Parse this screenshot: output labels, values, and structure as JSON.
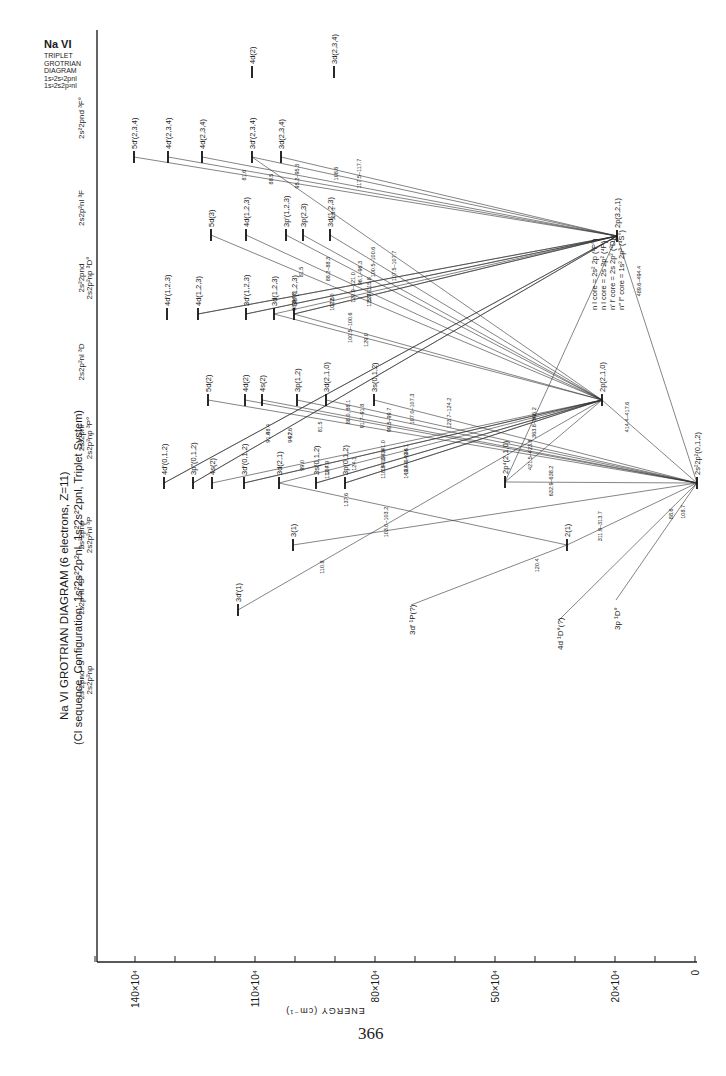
{
  "page": {
    "number": "366",
    "title": "Na VI  GROTRIAN DIAGRAM (6 electrons, Z=11)",
    "subtitle": "(CI sequence, Configuration: 1s²2s²2p²nl, 1s²2s²2pnl, Triplet System)",
    "corner_title": [
      "Na VI",
      "TRIPLET",
      "GROTRIAN",
      "DIAGRAM",
      "1s²2s²2pnl",
      "1s²2s2p²nl"
    ]
  },
  "chart_data": {
    "type": "grotrian-diagram",
    "title": "Na VI GROTRIAN DIAGRAM (6 electrons, Z=11)",
    "subtitle": "(CI sequence, Configuration: 1s²2s²2p²nl, 1s²2s²2pnl, Triplet System)",
    "xlabel": "ENERGY (cm⁻¹)",
    "axis": {
      "orientation": "horizontal, decreasing to the right",
      "ticks": [
        {
          "label": "140×10⁴",
          "value": 1400000
        },
        {
          "label": "110×10⁴",
          "value": 1100000
        },
        {
          "label": "80×10⁴",
          "value": 800000
        },
        {
          "label": "50×10⁴",
          "value": 500000
        },
        {
          "label": "20×10⁴",
          "value": 200000
        },
        {
          "label": "0",
          "value": 0
        }
      ],
      "minor_tick_step": 100000,
      "range": [
        0,
        1500000
      ]
    },
    "columns": [
      {
        "id": "3Fo",
        "label": "2s²2pnd ³F°",
        "y": 78
      },
      {
        "id": "3F",
        "label": "2s2p²nl ³F",
        "y": 168
      },
      {
        "id": "3Do",
        "label": "2s²2pnd / 2s2p²np ³D°",
        "y": 238
      },
      {
        "id": "3D",
        "label": "2s2p²nl ³D",
        "y": 322
      },
      {
        "id": "3Po",
        "label": "2s²2pnl / 2s2p²np ³P°",
        "y": 398
      },
      {
        "id": "3P",
        "label": "2s²2pnp / 2s2p²nl ³P",
        "y": 495
      },
      {
        "id": "3So",
        "label": "2s2p²nl ³S°",
        "y": 555
      },
      {
        "id": "3S",
        "label": "2s²2pnd ³S / 2s2p²np",
        "y": 640
      }
    ],
    "legend": [
      "n l core = 2s² 2p (²P°)",
      "n l core = 2s 2p² (⁴P)",
      "n′ l′ core = 2s 2p² (²D)",
      "n‴ l‴ core = 1s² 2p³ (⁴S°)"
    ],
    "levels": [
      {
        "id": "gs",
        "label": "2s²2p²(0,1,2)",
        "x": 697,
        "y": 483
      },
      {
        "id": "p321",
        "label": "2p(3,2,1)",
        "x": 617,
        "y": 236
      },
      {
        "id": "p210",
        "label": "2p(2,1,0)",
        "x": 602,
        "y": 400
      },
      {
        "id": "p4",
        "label": "2p⁴(2,1,0)",
        "x": 505,
        "y": 482
      },
      {
        "id": "s21",
        "label": "2(1)",
        "x": 567,
        "y": 545
      },
      {
        "id": "fo_4d",
        "label": "4d(2)",
        "x": 252,
        "y": 72
      },
      {
        "id": "fo_3d",
        "label": "3d(2,3,4)",
        "x": 334,
        "y": 72
      },
      {
        "id": "f_5dp",
        "label": "5d′(2,3,4)",
        "x": 134,
        "y": 157
      },
      {
        "id": "f_4dp",
        "label": "4d′(2,3,4)",
        "x": 168,
        "y": 157
      },
      {
        "id": "f_4d",
        "label": "4d(2,3,4)",
        "x": 202,
        "y": 157
      },
      {
        "id": "f_3dp",
        "label": "3d′(2,3,4)",
        "x": 252,
        "y": 157
      },
      {
        "id": "f_3d",
        "label": "3d(2,3,4)",
        "x": 281,
        "y": 157
      },
      {
        "id": "do_5d",
        "label": "5d(3)",
        "x": 211,
        "y": 235
      },
      {
        "id": "do_4d",
        "label": "4d(1,2,3)",
        "x": 246,
        "y": 235
      },
      {
        "id": "do_3pp",
        "label": "3p′(1,2,3)",
        "x": 286,
        "y": 235
      },
      {
        "id": "do_3p",
        "label": "3p(2,3)",
        "x": 303,
        "y": 235
      },
      {
        "id": "do_3d",
        "label": "3d(1,2,3)",
        "x": 330,
        "y": 235
      },
      {
        "id": "d_4dp",
        "label": "4d′(1,2,3)",
        "x": 167,
        "y": 314
      },
      {
        "id": "d_4d",
        "label": "4d(1,2,3)",
        "x": 198,
        "y": 314
      },
      {
        "id": "d_3dp",
        "label": "3d′(1,2,3)",
        "x": 246,
        "y": 314
      },
      {
        "id": "d_3d",
        "label": "3d(1,2,3)",
        "x": 274,
        "y": 314
      },
      {
        "id": "d_3sp",
        "label": "3s′(1,2,3)",
        "x": 294,
        "y": 314
      },
      {
        "id": "po_5d",
        "label": "5d(2)",
        "x": 208,
        "y": 400
      },
      {
        "id": "po_4d",
        "label": "4d(2)",
        "x": 245,
        "y": 400
      },
      {
        "id": "po_4s",
        "label": "4s(2)",
        "x": 262,
        "y": 400
      },
      {
        "id": "po_3p",
        "label": "3p(1,2)",
        "x": 297,
        "y": 400
      },
      {
        "id": "po_3d",
        "label": "3d(2,1,0)",
        "x": 326,
        "y": 400
      },
      {
        "id": "po_3s",
        "label": "3s(0,1,2)",
        "x": 374,
        "y": 400
      },
      {
        "id": "p_4dp",
        "label": "4d′(0,1,2)",
        "x": 164,
        "y": 483
      },
      {
        "id": "p_3pp",
        "label": "3p‴(0,1,2)",
        "x": 193,
        "y": 483
      },
      {
        "id": "p_4s",
        "label": "4s(2)",
        "x": 212,
        "y": 483
      },
      {
        "id": "p_3dp",
        "label": "3d′(0,1,2)",
        "x": 244,
        "y": 483
      },
      {
        "id": "p_3d",
        "label": "3d(2,1)",
        "x": 279,
        "y": 483
      },
      {
        "id": "p_3s",
        "label": "3s(0,1,2)",
        "x": 316,
        "y": 483
      },
      {
        "id": "p_3p",
        "label": "3p(0,1,2)",
        "x": 345,
        "y": 483
      },
      {
        "id": "so_3",
        "label": "3(1)",
        "x": 293,
        "y": 545
      },
      {
        "id": "s_3dp",
        "label": "3d′(1)",
        "x": 238,
        "y": 610
      }
    ],
    "transitions": [
      {
        "from": "f_5dp",
        "to": "p321",
        "wavelength": "81.6"
      },
      {
        "from": "f_4dp",
        "to": "p321",
        "wavelength": "88.5"
      },
      {
        "from": "f_4d",
        "to": "p321",
        "wavelength": "95.2–95.3"
      },
      {
        "from": "f_3dp",
        "to": "p321",
        "wavelength": "108.6"
      },
      {
        "from": "f_3dp",
        "to": "p210",
        "wavelength": "113.1"
      },
      {
        "from": "f_3d",
        "to": "p321",
        "wavelength": "117.5–117.7"
      },
      {
        "from": "do_5d",
        "to": "p210",
        "wavelength": "81.5"
      },
      {
        "from": "do_4d",
        "to": "p210",
        "wavelength": "88.2–88.3"
      },
      {
        "from": "do_3pp",
        "to": "p210",
        "wavelength": "96.1–96.3"
      },
      {
        "from": "do_3p",
        "to": "p210",
        "wavelength": "100.5–100.6"
      },
      {
        "from": "do_3d",
        "to": "p210",
        "wavelength": "107.5–107.7"
      },
      {
        "from": "d_4d",
        "to": "p321",
        "wavelength": "98.3"
      },
      {
        "from": "d_4d",
        "to": "p321",
        "wavelength": "94.8"
      },
      {
        "from": "d_3dp",
        "to": "p321",
        "wavelength": "112.0"
      },
      {
        "from": "d_3dp",
        "to": "p321",
        "wavelength": "107.5"
      },
      {
        "from": "d_3d",
        "to": "p321",
        "wavelength": "120.9–121.0"
      },
      {
        "from": "d_3sp",
        "to": "p321",
        "wavelength": "115.7–115.8"
      },
      {
        "from": "d_3sp",
        "to": "p210",
        "wavelength": "129.0"
      },
      {
        "from": "d_3sp",
        "to": "p321",
        "wavelength": "123.1"
      },
      {
        "from": "d_3d",
        "to": "p210",
        "wavelength": "100.5–100.6"
      },
      {
        "from": "po_5d",
        "to": "gs",
        "wavelength": "81.5"
      },
      {
        "from": "po_4d",
        "to": "gs",
        "wavelength": "88.0, 88.1"
      },
      {
        "from": "po_4s",
        "to": "gs",
        "wavelength": "91.7–91.8"
      },
      {
        "from": "po_3p",
        "to": "gs",
        "wavelength": "99.5–99.7"
      },
      {
        "from": "po_3d",
        "to": "gs",
        "wavelength": "107.0–107.3"
      },
      {
        "from": "po_3s",
        "to": "gs",
        "wavelength": "123.7–124.2"
      },
      {
        "from": "p_4dp",
        "to": "p321",
        "wavelength": "91.4"
      },
      {
        "from": "p_4dp",
        "to": "p321",
        "wavelength": "88.4"
      },
      {
        "from": "p_3pp",
        "to": "p321",
        "wavelength": "97.6"
      },
      {
        "from": "p_3pp",
        "to": "p321",
        "wavelength": "94.2"
      },
      {
        "from": "p_4s",
        "to": "p210",
        "wavelength": "99.0"
      },
      {
        "from": "p_3dp",
        "to": "p210",
        "wavelength": "107.9"
      },
      {
        "from": "p_3dp",
        "to": "p210",
        "wavelength": "112.4"
      },
      {
        "from": "p_3d",
        "to": "p210",
        "wavelength": "124.1"
      },
      {
        "from": "p_3d",
        "to": "s21",
        "wavelength": "137.6"
      },
      {
        "from": "p_3s",
        "to": "p210",
        "wavelength": "118.5–118.6"
      },
      {
        "from": "p_3s",
        "to": "p210",
        "wavelength": "140.8–141.0"
      },
      {
        "from": "p_3p",
        "to": "p210",
        "wavelength": "133.8–134.1"
      },
      {
        "from": "p_3p",
        "to": "p210",
        "wavelength": "149.4–149.6"
      },
      {
        "from": "so_3",
        "to": "gs",
        "wavelength": "103.0–103.2"
      },
      {
        "from": "s_3dp",
        "to": "p210",
        "wavelength": "110.8"
      },
      {
        "from": "p4",
        "to": "gs",
        "wavelength": "632.9–638.2"
      },
      {
        "from": "p4",
        "to": "p210",
        "wavelength": "421.5–423.8"
      },
      {
        "from": "p4",
        "to": "p321",
        "wavelength": "363.8–366.2"
      },
      {
        "from": "p210",
        "to": "gs",
        "wavelength": "414.4–417.6"
      },
      {
        "from": "p321",
        "to": "gs",
        "wavelength": "489.6–494.4"
      },
      {
        "from": "s21",
        "to": "gs",
        "wavelength": "311.9–313.7"
      },
      {
        "from": "s21",
        "to": "3d′ ¹P(?)",
        "wavelength": "120.4"
      },
      {
        "from": "gs",
        "to": "4d ¹D°(?)",
        "wavelength": "88.6"
      },
      {
        "from": "gs",
        "to": "3p ¹D°",
        "wavelength": "108.7"
      }
    ],
    "singlet_refs": [
      {
        "label": "3d′ ¹P(?)",
        "x": 415,
        "y": 605
      },
      {
        "label": "4d ¹D°(?)",
        "x": 563,
        "y": 620
      },
      {
        "label": "3p ¹D°",
        "x": 620,
        "y": 600
      }
    ]
  }
}
